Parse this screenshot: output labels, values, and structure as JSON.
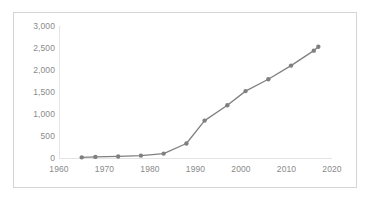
{
  "chart_data": {
    "type": "line",
    "title": "",
    "subtitle": "",
    "xlabel": "",
    "ylabel": "",
    "xlim": [
      1960,
      2020
    ],
    "ylim": [
      0,
      3000
    ],
    "grid": false,
    "legend": null,
    "legend_position": "none",
    "series_color": "#808080",
    "marker": "circle",
    "x": [
      1965,
      1968,
      1973,
      1978,
      1983,
      1988,
      1992,
      1997,
      2001,
      2006,
      2011,
      2016,
      2017
    ],
    "values": [
      15,
      25,
      35,
      55,
      100,
      330,
      850,
      1200,
      1520,
      1790,
      2100,
      2440,
      2530
    ],
    "points": [
      {
        "x": 1965,
        "y": 15
      },
      {
        "x": 1968,
        "y": 25
      },
      {
        "x": 1973,
        "y": 35
      },
      {
        "x": 1978,
        "y": 55
      },
      {
        "x": 1983,
        "y": 100
      },
      {
        "x": 1988,
        "y": 330
      },
      {
        "x": 1992,
        "y": 850
      },
      {
        "x": 1997,
        "y": 1200
      },
      {
        "x": 2001,
        "y": 1520
      },
      {
        "x": 2006,
        "y": 1790
      },
      {
        "x": 2011,
        "y": 2100
      },
      {
        "x": 2016,
        "y": 2440
      },
      {
        "x": 2017,
        "y": 2530
      }
    ],
    "xticks": [
      1960,
      1970,
      1980,
      1990,
      2000,
      2010,
      2020
    ],
    "xtick_labels": [
      "1960",
      "1970",
      "1980",
      "1990",
      "2000",
      "2010",
      "2020"
    ],
    "yticks": [
      0,
      500,
      1000,
      1500,
      2000,
      2500,
      3000
    ],
    "ytick_labels": [
      "0",
      "500",
      "1,000",
      "1,500",
      "2,000",
      "2,500",
      "3,000"
    ]
  },
  "style": {
    "border_color": "#d4d4d4",
    "axis_color": "#e4e4e4",
    "tick_text_color": "#8a8a8a",
    "background": "#ffffff"
  }
}
